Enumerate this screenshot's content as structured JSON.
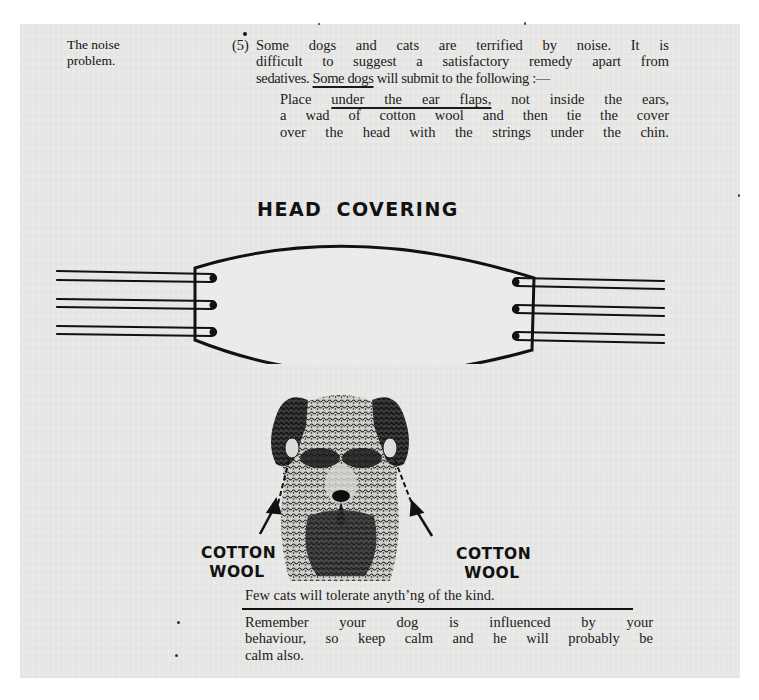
{
  "document": {
    "margin_note": [
      "The noise",
      "problem."
    ],
    "paragraph_number": "(5)",
    "intro_lines": [
      "Some dogs and cats are terrified by noise.    It is",
      "difficult to suggest a satisfactory remedy apart from",
      {
        "before": "sedatives. ",
        "underlined": "Some dogs",
        "after": " will submit to the following :—"
      }
    ],
    "instruction_lines": [
      {
        "before": "Place ",
        "underlined": "under the ear flaps,",
        "after": " not inside the ears,"
      },
      "a wad of cotton wool and then tie the cover",
      "over the head with the strings under the chin."
    ],
    "diagram": {
      "title": "HEAD  COVERING",
      "strings_per_side": 3,
      "labels": {
        "left": [
          "COTTON",
          "WOOL"
        ],
        "right": [
          "COTTON",
          "WOOL"
        ]
      },
      "illustration": "terrier-dog-face-with-cotton-wool-in-ears"
    },
    "cats_note": "Few cats will tolerate anyth’ng of the kind.",
    "closing_lines": [
      "Remember your dog is influenced by your",
      "behaviour, so keep calm and he will probably be",
      "calm also."
    ],
    "colors": {
      "page": "#e9e9e7",
      "ink": "#111111",
      "border": "#ffffff"
    }
  }
}
